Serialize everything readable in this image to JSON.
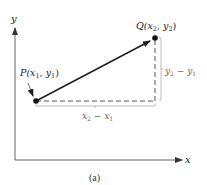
{
  "figure": {
    "caption": "(a)",
    "axes": {
      "x_label": "x",
      "y_label": "y"
    },
    "points": {
      "P": {
        "name": "P",
        "label_prefix": "P(",
        "x_sub": "x",
        "x_idx": "1",
        "sep": ", ",
        "y_sub": "y",
        "y_idx": "1",
        "close": ")"
      },
      "Q": {
        "name": "Q",
        "label_prefix": "Q(",
        "x_sub": "x",
        "x_idx": "2",
        "sep": ", ",
        "y_sub": "y",
        "y_idx": "2",
        "close": ")"
      }
    },
    "differences": {
      "dy": {
        "a": "y",
        "a_idx": "2",
        "op": " − ",
        "b": "y",
        "b_idx": "1"
      },
      "dx": {
        "a": "x",
        "a_idx": "2",
        "op": " − ",
        "b": "x",
        "b_idx": "1"
      }
    },
    "colors": {
      "vector": "#222222",
      "axes": "#555555",
      "dashed": "#555555",
      "bracket": "#aaaaaa"
    }
  }
}
